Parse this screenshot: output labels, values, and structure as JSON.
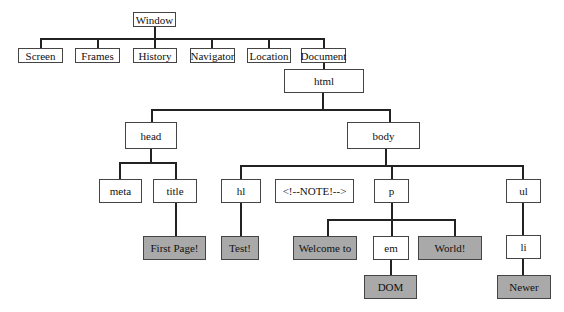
{
  "diagram": {
    "colors": {
      "element_fill": "#ffffff",
      "text_node_fill": "#a9a9a9",
      "border": "#444444",
      "line": "#222222"
    },
    "nodes": {
      "window": "Window",
      "screen": "Screen",
      "frames": "Frames",
      "history": "History",
      "navigator": "Navigator",
      "location": "Location",
      "document": "Document",
      "html": "html",
      "head": "head",
      "body": "body",
      "meta": "meta",
      "title": "title",
      "h1": "hl",
      "comment": "<!--NOTE!-->",
      "p": "p",
      "ul": "ul",
      "first_page": "First Page!",
      "test": "Test!",
      "welcome": "Welcome to",
      "em": "em",
      "world": "World!",
      "li": "li",
      "dom": "DOM",
      "newer": "Newer"
    }
  }
}
